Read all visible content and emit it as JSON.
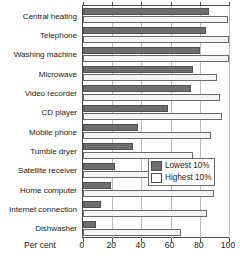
{
  "chart_data": {
    "type": "bar",
    "orientation": "horizontal",
    "title": "",
    "xlabel": "Per cent",
    "ylabel": "",
    "xlim": [
      0,
      100
    ],
    "xticks": [
      0,
      20,
      40,
      60,
      80,
      100
    ],
    "grid": true,
    "legend_position": "middle-right",
    "categories": [
      "Central heating",
      "Telephone",
      "Washing machine",
      "Microwave",
      "Video recorder",
      "CD player",
      "Mobile phone",
      "Tumble dryer",
      "Satellite receiver",
      "Home computer",
      "Internet connection",
      "Dishwasher"
    ],
    "series": [
      {
        "name": "Lowest 10%",
        "color": "#6e6e6e",
        "values": [
          86,
          84,
          80,
          75,
          74,
          58,
          38,
          34,
          22,
          19,
          12,
          9
        ]
      },
      {
        "name": "Highest 10%",
        "color": "#f4f4f4",
        "values": [
          99,
          100,
          100,
          92,
          94,
          95,
          88,
          75,
          59,
          90,
          85,
          67
        ]
      }
    ]
  },
  "axis": {
    "x_title": "Per cent",
    "tick_labels": [
      "0",
      "20",
      "40",
      "60",
      "80",
      "100"
    ]
  },
  "legend": {
    "items": [
      {
        "label": "Lowest 10%",
        "swatch": "dark-gray-swatch"
      },
      {
        "label": "Highest 10%",
        "swatch": "white-swatch"
      }
    ]
  }
}
